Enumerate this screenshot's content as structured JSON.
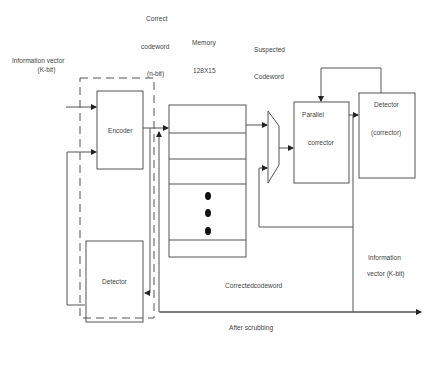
{
  "diagram": {
    "labels": {
      "information_vector_in": [
        "Information vector",
        "(K-bit)"
      ],
      "correct_codeword": [
        "Correct",
        "codeword",
        "(n-bit)"
      ],
      "memory": [
        "Memory",
        "128X15"
      ],
      "suspected_codeword": [
        "Suspected",
        "Codeword"
      ],
      "corrected_codeword": "Correctedcodeword",
      "after_scrubbing": "After scrubbing",
      "information_vector_out": [
        "Information",
        "vector (K-bit)"
      ]
    },
    "blocks": {
      "encoder": "Encoder",
      "detector_left": "Detector",
      "parallel_corrector": [
        "Parallel",
        "corrector"
      ],
      "detector_right": [
        "Detector",
        "(corrector)"
      ]
    },
    "memory_rows": 6,
    "line_color": "#555555"
  }
}
